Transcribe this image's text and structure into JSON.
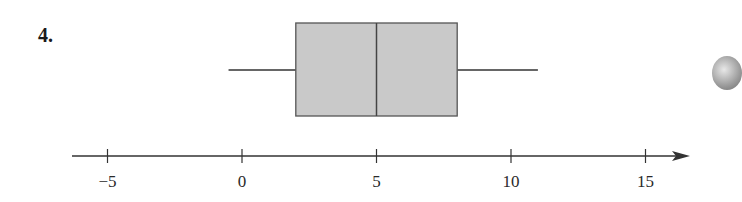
{
  "problem": {
    "number_label": "4."
  },
  "chart_data": {
    "type": "boxplot",
    "title": "",
    "xlabel": "",
    "ylabel": "",
    "orientation": "horizontal",
    "axis": {
      "min": -6.5,
      "max": 16.2,
      "ticks": [
        -5,
        0,
        5,
        10,
        15
      ],
      "tick_labels": [
        "−5",
        "0",
        "5",
        "10",
        "15"
      ],
      "arrow_right": true,
      "grid": false
    },
    "box": {
      "min": -0.5,
      "q1": 2,
      "median": 5,
      "q3": 8,
      "max": 11,
      "fill": "#c9c9c9",
      "stroke": "#555555"
    }
  },
  "colors": {
    "axis": "#333333",
    "whisker": "#666666",
    "box_fill": "#c9c9c9"
  }
}
